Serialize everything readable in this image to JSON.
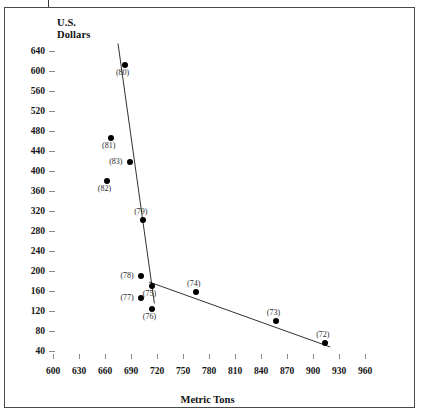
{
  "figure": {
    "y_axis_title_line1": "U.S.",
    "y_axis_title_line2": "Dollars",
    "x_axis_title": "Metric Tons"
  },
  "chart_data": {
    "type": "scatter",
    "title": "",
    "xlabel": "Metric Tons",
    "ylabel": "U.S. Dollars",
    "xlim": [
      585,
      975
    ],
    "ylim": [
      20,
      660
    ],
    "grid": false,
    "legend": "none",
    "x_ticks": [
      600,
      630,
      660,
      690,
      720,
      750,
      780,
      810,
      840,
      870,
      900,
      930,
      960
    ],
    "y_ticks": [
      40,
      80,
      120,
      160,
      200,
      240,
      280,
      320,
      360,
      400,
      440,
      480,
      520,
      560,
      600,
      640
    ],
    "points": [
      {
        "label": "(80)",
        "x": 683,
        "y": 613,
        "label_pos": "below"
      },
      {
        "label": "(81)",
        "x": 667,
        "y": 467,
        "label_pos": "below"
      },
      {
        "label": "(83)",
        "x": 689,
        "y": 418,
        "label_pos": "left"
      },
      {
        "label": "(82)",
        "x": 662,
        "y": 380,
        "label_pos": "below"
      },
      {
        "label": "(79)",
        "x": 704,
        "y": 303,
        "label_pos": "above"
      },
      {
        "label": "(78)",
        "x": 702,
        "y": 190,
        "label_pos": "left"
      },
      {
        "label": "(75)",
        "x": 714,
        "y": 170,
        "label_pos": "below"
      },
      {
        "label": "(77)",
        "x": 702,
        "y": 147,
        "label_pos": "left"
      },
      {
        "label": "(76)",
        "x": 714,
        "y": 124,
        "label_pos": "below"
      },
      {
        "label": "(74)",
        "x": 765,
        "y": 158,
        "label_pos": "above"
      },
      {
        "label": "(73)",
        "x": 857,
        "y": 100,
        "label_pos": "above"
      },
      {
        "label": "(72)",
        "x": 914,
        "y": 56,
        "label_pos": "above"
      }
    ],
    "trend_lines": [
      {
        "name": "steep-line",
        "x1": 675,
        "y1": 655,
        "x2": 717,
        "y2": 135
      },
      {
        "name": "shallow-line",
        "x1": 711,
        "y1": 178,
        "x2": 920,
        "y2": 48
      }
    ]
  }
}
